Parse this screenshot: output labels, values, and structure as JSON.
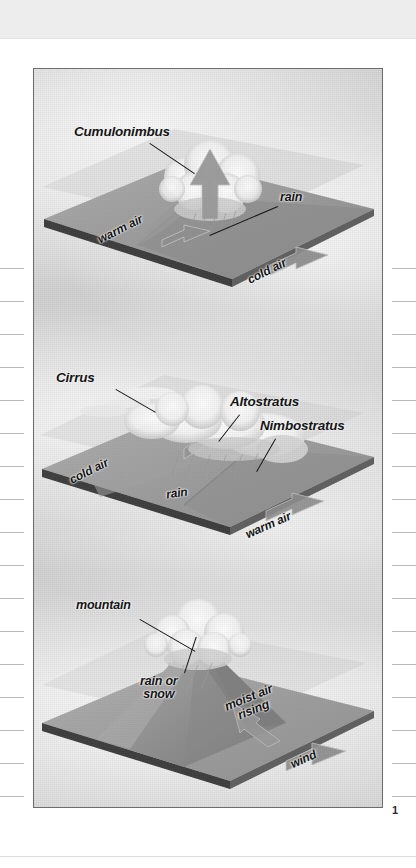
{
  "page": {
    "page_number": "1",
    "figure_caption": "",
    "margin_tick_count_left": 17,
    "margin_tick_count_right": 17
  },
  "figure": {
    "title": "",
    "border_color": "#6d6d6d",
    "background_color": "#dadada",
    "panels": [
      {
        "id": "cold-front",
        "name": "cold-front-panel",
        "labels": [
          {
            "id": "cumulonimbus",
            "text": "Cumulonimbus",
            "style": "big",
            "x": 40,
            "y": 62,
            "leader": {
              "x": 113,
              "y": 80,
              "len": 52,
              "angle": 38
            }
          },
          {
            "id": "rain",
            "text": "rain",
            "style": "mid",
            "x": 240,
            "y": 128,
            "leader": {
              "x": 239,
              "y": 143,
              "len": 70,
              "angle": 150
            }
          },
          {
            "id": "warm-air",
            "text": "warm air",
            "style": "plain",
            "x": 64,
            "y": 158,
            "rotate": -27
          },
          {
            "id": "cold-air",
            "text": "cold air",
            "style": "plain",
            "x": 212,
            "y": 203,
            "rotate": -27
          }
        ],
        "arrows": [
          {
            "id": "warm-air-arrow",
            "direction": "left"
          },
          {
            "id": "cold-air-arrow",
            "direction": "left"
          },
          {
            "id": "updraft-arrow",
            "direction": "up"
          }
        ],
        "air_masses": [
          "warm air",
          "cold air"
        ],
        "cloud_types": [
          "Cumulonimbus"
        ],
        "precipitation": [
          "rain"
        ]
      },
      {
        "id": "warm-front",
        "name": "warm-front-panel",
        "labels": [
          {
            "id": "cirrus",
            "text": "Cirrus",
            "style": "big",
            "x": 22,
            "y": 68,
            "leader": {
              "x": 80,
              "y": 84,
              "len": 44,
              "angle": 32
            }
          },
          {
            "id": "altostratus",
            "text": "Altostratus",
            "style": "big",
            "x": 196,
            "y": 92,
            "leader": {
              "x": 204,
              "y": 110,
              "len": 34,
              "angle": 127
            }
          },
          {
            "id": "nimbostratus",
            "text": "Nimbostratus",
            "style": "big",
            "x": 228,
            "y": 116,
            "leader": {
              "x": 240,
              "y": 134,
              "len": 38,
              "angle": 122
            }
          },
          {
            "id": "cold-air",
            "text": "cold air",
            "style": "plain",
            "x": 38,
            "y": 160,
            "rotate": -27
          },
          {
            "id": "rain",
            "text": "rain",
            "style": "plain",
            "x": 134,
            "y": 182,
            "rotate": -8
          },
          {
            "id": "warm-air",
            "text": "warm air",
            "style": "plain",
            "x": 212,
            "y": 216,
            "rotate": -24
          }
        ],
        "arrows": [
          {
            "id": "warm-air-arrow",
            "direction": "left"
          },
          {
            "id": "overrun-arrow",
            "direction": "up-left"
          }
        ],
        "air_masses": [
          "cold air",
          "warm air"
        ],
        "cloud_types": [
          "Cirrus",
          "Altostratus",
          "Nimbostratus"
        ],
        "precipitation": [
          "rain"
        ]
      },
      {
        "id": "orographic-lift",
        "name": "orographic-lift-panel",
        "labels": [
          {
            "id": "mountain",
            "text": "mountain",
            "style": "mid",
            "x": 42,
            "y": 52,
            "leader": {
              "x": 104,
              "y": 72,
              "len": 62,
              "angle": 31
            }
          },
          {
            "id": "rain-or-snow",
            "text": "rain or\nsnow",
            "style": "mid",
            "x": 110,
            "y": 130,
            "leader": {
              "x": 152,
              "y": 126,
              "len": 38,
              "angle": -74
            }
          },
          {
            "id": "moist-air-rising",
            "text": "moist air\nrising",
            "style": "mid",
            "x": 196,
            "y": 146,
            "rotate": -22
          },
          {
            "id": "wind",
            "text": "wind",
            "style": "plain",
            "x": 258,
            "y": 208,
            "rotate": -24
          }
        ],
        "arrows": [
          {
            "id": "wind-arrow",
            "direction": "left"
          },
          {
            "id": "upslope-arrow",
            "direction": "up-left"
          }
        ],
        "air_masses": [],
        "cloud_types": [],
        "precipitation": [
          "rain or snow"
        ]
      }
    ]
  },
  "colors": {
    "plane_top": "#9e9e9e",
    "plane_top_light": "#b4b4b4",
    "plane_edge": "#3a3a3a",
    "plane_side": "#6f6f6f",
    "arrow_fill": "#8d8d8d",
    "arrow_stroke": "#bdbdbd",
    "cloud_white": "#fbfbfb",
    "cloud_shadow": "#b0b0b0",
    "label_text": "#101010",
    "frame": "#6d6d6d",
    "page_band": "#ededed",
    "tick": "#b9b9b9"
  }
}
